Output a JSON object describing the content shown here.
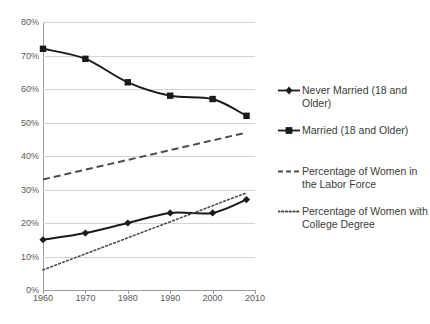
{
  "chart_data": {
    "type": "line",
    "title": "",
    "subtitle": "",
    "xlabel": "",
    "ylabel": "",
    "xlim": [
      1960,
      2010
    ],
    "ylim": [
      0,
      80
    ],
    "grid": true,
    "legend_position": "right",
    "x_ticks": [
      "1960",
      "1970",
      "1980",
      "1990",
      "2000",
      "2010"
    ],
    "x_tick_values": [
      1960,
      1970,
      1980,
      1990,
      2000,
      2010
    ],
    "y_ticks": [
      "0%",
      "10%",
      "20%",
      "30%",
      "40%",
      "50%",
      "60%",
      "70%",
      "80%"
    ],
    "y_tick_values": [
      0,
      10,
      20,
      30,
      40,
      50,
      60,
      70,
      80
    ],
    "series": [
      {
        "name": "Never Married (18 and Older)",
        "marker": "diamond",
        "style": "solid",
        "color": "#1a1a1a",
        "x": [
          1960,
          1970,
          1980,
          1990,
          2000,
          2008
        ],
        "values": [
          15,
          17,
          20,
          23,
          23,
          27
        ]
      },
      {
        "name": "Married (18 and Older)",
        "marker": "square",
        "style": "solid",
        "color": "#1a1a1a",
        "x": [
          1960,
          1970,
          1980,
          1990,
          2000,
          2008
        ],
        "values": [
          72,
          69,
          62,
          58,
          57,
          52
        ]
      },
      {
        "name": "Percentage of Women in the Labor Force",
        "marker": "none",
        "style": "dashed",
        "color": "#4d4d4d",
        "x": [
          1960,
          2008
        ],
        "values": [
          33,
          47
        ]
      },
      {
        "name": "Percentage of Women with College Degree",
        "marker": "none",
        "style": "dotted",
        "color": "#4d4d4d",
        "x": [
          1960,
          2008
        ],
        "values": [
          6,
          29
        ]
      }
    ]
  },
  "legend": {
    "items": [
      {
        "label": "Never Married (18 and Older)",
        "key": "line-diamond-marker"
      },
      {
        "label": "Married (18 and Older)",
        "key": "line-square-marker"
      },
      {
        "label": "Percentage of Women in the Labor Force",
        "key": "dashed-line"
      },
      {
        "label": "Percentage of Women with College Degree",
        "key": "dotted-line"
      }
    ]
  },
  "colors": {
    "series_primary": "#1a1a1a",
    "series_secondary": "#4d4d4d",
    "gridline": "#d4d4d4",
    "axis": "#9a9a9a",
    "tick_text": "#595959",
    "legend_text": "#3b3b3b",
    "background": "#ffffff"
  }
}
